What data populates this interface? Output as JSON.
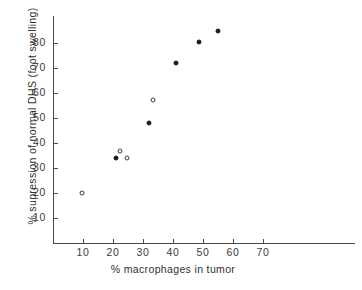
{
  "chart_data": {
    "type": "scatter",
    "title": "",
    "xlabel": "% macrophages in tumor",
    "ylabel": "% supression of normal DHS (foot swelling)",
    "xlim": [
      0,
      80
    ],
    "ylim": [
      0,
      90
    ],
    "xticks": [
      10,
      20,
      30,
      40,
      50,
      60,
      70
    ],
    "yticks": [
      10,
      20,
      30,
      40,
      50,
      60,
      70,
      80
    ],
    "xtick_labels": [
      "10",
      "20",
      "30",
      "40",
      "50",
      "60",
      "70"
    ],
    "ytick_labels": [
      "10",
      "20",
      "30",
      "40",
      "50",
      "60",
      "70",
      "80"
    ],
    "grid": false,
    "legend": "none",
    "series": [
      {
        "name": "open-circles",
        "marker": "open circle",
        "color": "#3d3d3d",
        "points": [
          {
            "x": 9.5,
            "y": 20.0
          },
          {
            "x": 22.3,
            "y": 36.8
          },
          {
            "x": 24.7,
            "y": 34.2
          },
          {
            "x": 33.2,
            "y": 57.2
          }
        ]
      },
      {
        "name": "filled-circles",
        "marker": "filled circle",
        "color": "#1b1b1b",
        "points": [
          {
            "x": 21.0,
            "y": 34.2
          },
          {
            "x": 32.0,
            "y": 48.0
          },
          {
            "x": 41.0,
            "y": 72.2
          },
          {
            "x": 48.5,
            "y": 80.6
          },
          {
            "x": 55.0,
            "y": 85.0
          }
        ]
      }
    ]
  }
}
